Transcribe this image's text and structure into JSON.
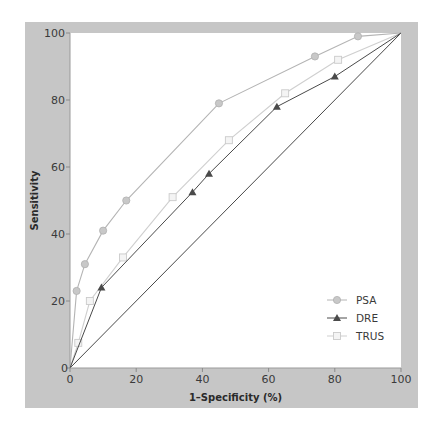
{
  "chart_data": {
    "type": "line",
    "title": "",
    "xlabel": "1–Specificity (%)",
    "ylabel": "Sensitivity",
    "xlim": [
      0,
      100
    ],
    "ylim": [
      0,
      100
    ],
    "x_ticks": [
      "0",
      "20",
      "40",
      "60",
      "80",
      "100"
    ],
    "y_ticks": [
      "0",
      "20",
      "40",
      "60",
      "80",
      "100"
    ],
    "grid": false,
    "legend_position": "lower right",
    "reference_line": {
      "name": "chance",
      "points": [
        [
          0,
          0
        ],
        [
          100,
          100
        ]
      ]
    },
    "series": [
      {
        "name": "PSA",
        "marker": "circle",
        "color": "#b4b4b4",
        "points": [
          [
            0,
            0
          ],
          [
            2,
            23
          ],
          [
            4.5,
            31
          ],
          [
            10,
            41
          ],
          [
            17,
            50
          ],
          [
            45,
            79
          ],
          [
            74,
            93
          ],
          [
            87,
            99
          ],
          [
            100,
            100
          ]
        ]
      },
      {
        "name": "DRE",
        "marker": "triangle",
        "color": "#4a4a4a",
        "points": [
          [
            0,
            0
          ],
          [
            9.5,
            24
          ],
          [
            37,
            52.5
          ],
          [
            42,
            58
          ],
          [
            62.5,
            78
          ],
          [
            80,
            87
          ],
          [
            100,
            100
          ]
        ]
      },
      {
        "name": "TRUS",
        "marker": "square",
        "color": "#cfcfcf",
        "points": [
          [
            0,
            0
          ],
          [
            2.5,
            7.5
          ],
          [
            6,
            20
          ],
          [
            16,
            33
          ],
          [
            31,
            51
          ],
          [
            48,
            68
          ],
          [
            65,
            82
          ],
          [
            81,
            92
          ],
          [
            100,
            100
          ]
        ]
      }
    ]
  }
}
